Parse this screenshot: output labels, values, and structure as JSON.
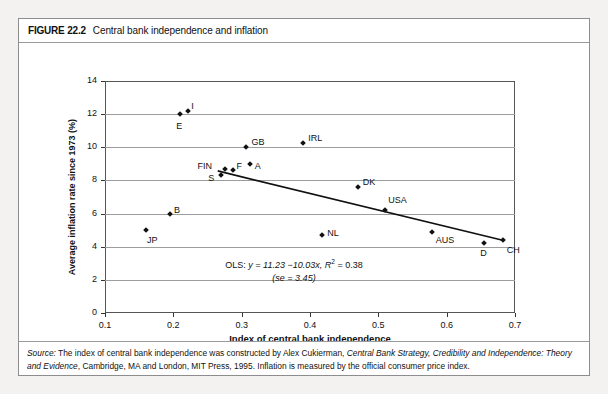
{
  "figure": {
    "number": "FIGURE 22.2",
    "title": "Central bank independence and inflation"
  },
  "source": {
    "label": "Source:",
    "text_part1": " The index of central bank independence was constructed by Alex Cukierman, ",
    "book_title": "Central Bank Strategy, Credibility and Independence: Theory and Evidence",
    "text_part2": ", Cambridge, MA and London, MIT Press, 1995. Inflation is measured by the official consumer price index."
  },
  "annotation": {
    "line1_prefix": "OLS: ",
    "line1_eq": "y = 11.23 −10.03x",
    "line1_r2_pre": ", R",
    "line1_r2_sup": "2",
    "line1_r2_post": " = 0.38",
    "line2": "(se = 3.45)"
  },
  "chart_data": {
    "type": "scatter",
    "title": "Central bank independence and inflation",
    "xlabel": "Index of central bank independence",
    "ylabel": "Average inflation rate since 1973 (%)",
    "xlim": [
      0.1,
      0.7
    ],
    "ylim": [
      0,
      14
    ],
    "xticks": [
      "0.1",
      "0.2",
      "0.3",
      "0.4",
      "0.5",
      "0.6",
      "0.7"
    ],
    "xtick_values": [
      0.1,
      0.2,
      0.3,
      0.4,
      0.5,
      0.6,
      0.7
    ],
    "yticks": [
      "0",
      "2",
      "4",
      "6",
      "8",
      "10",
      "12",
      "14"
    ],
    "ytick_values": [
      0,
      2,
      4,
      6,
      8,
      10,
      12,
      14
    ],
    "grid": "horizontal",
    "legend": "none",
    "points": [
      {
        "label": "JP",
        "x": 0.16,
        "y": 5.0,
        "label_dx": 1,
        "label_dy": 11
      },
      {
        "label": "B",
        "x": 0.195,
        "y": 6.0,
        "label_dx": 4,
        "label_dy": -3
      },
      {
        "label": "E",
        "x": 0.21,
        "y": 12.0,
        "label_dx": -4,
        "label_dy": 13
      },
      {
        "label": "I",
        "x": 0.222,
        "y": 12.2,
        "label_dx": 3,
        "label_dy": -4
      },
      {
        "label": "S",
        "x": 0.27,
        "y": 8.3,
        "label_dx": -13,
        "label_dy": 4
      },
      {
        "label": "FIN",
        "x": 0.275,
        "y": 8.7,
        "label_dx": -27,
        "label_dy": -2
      },
      {
        "label": "F",
        "x": 0.288,
        "y": 8.6,
        "label_dx": 3,
        "label_dy": -3
      },
      {
        "label": "A",
        "x": 0.312,
        "y": 9.0,
        "label_dx": 5,
        "label_dy": 3
      },
      {
        "label": "GB",
        "x": 0.307,
        "y": 10.0,
        "label_dx": 5,
        "label_dy": -4
      },
      {
        "label": "IRL",
        "x": 0.39,
        "y": 10.25,
        "label_dx": 5,
        "label_dy": -4
      },
      {
        "label": "NL",
        "x": 0.418,
        "y": 4.7,
        "label_dx": 5,
        "label_dy": -1
      },
      {
        "label": "DK",
        "x": 0.47,
        "y": 7.6,
        "label_dx": 5,
        "label_dy": -4
      },
      {
        "label": "USA",
        "x": 0.51,
        "y": 6.2,
        "label_dx": 3,
        "label_dy": -9
      },
      {
        "label": "AUS",
        "x": 0.578,
        "y": 4.9,
        "label_dx": 4,
        "label_dy": 9
      },
      {
        "label": "D",
        "x": 0.655,
        "y": 4.25,
        "label_dx": -4,
        "label_dy": 11
      },
      {
        "label": "CH",
        "x": 0.682,
        "y": 4.4,
        "label_dx": 4,
        "label_dy": 11
      }
    ],
    "regression": {
      "intercept": 11.23,
      "slope": -10.03,
      "r_squared": 0.38,
      "se": 3.45,
      "x_start": 0.265,
      "x_end": 0.682
    }
  }
}
